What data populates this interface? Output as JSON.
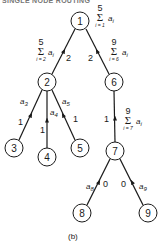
{
  "title": "SINGLE NODE ROUTING",
  "caption": "(b)",
  "nodes": [
    {
      "id": "1",
      "label": "1"
    },
    {
      "id": "2",
      "label": "2"
    },
    {
      "id": "3",
      "label": "3"
    },
    {
      "id": "4",
      "label": "4"
    },
    {
      "id": "5",
      "label": "5"
    },
    {
      "id": "6",
      "label": "6"
    },
    {
      "id": "7",
      "label": "7"
    },
    {
      "id": "8",
      "label": "8"
    },
    {
      "id": "9",
      "label": "9"
    }
  ],
  "edges": [
    {
      "from": "2",
      "to": "1",
      "weight": "2",
      "flow": "Σ a_i, i=2..5"
    },
    {
      "from": "6",
      "to": "1",
      "weight": "2",
      "flow": "Σ a_i, i=6..9"
    },
    {
      "from": "3",
      "to": "2",
      "weight": "1",
      "flow": "a3"
    },
    {
      "from": "4",
      "to": "2",
      "weight": "1",
      "flow": "a4"
    },
    {
      "from": "5",
      "to": "2",
      "weight": "1",
      "flow": "a5"
    },
    {
      "from": "7",
      "to": "6",
      "weight": "1",
      "flow": "Σ a_i, i=7..9"
    },
    {
      "from": "8",
      "to": "7",
      "weight": "0",
      "flow": "a8"
    },
    {
      "from": "9",
      "to": "7",
      "weight": "0",
      "flow": "a9"
    }
  ],
  "sums": {
    "node1": {
      "upper": "5",
      "lower": "i = 1",
      "var": "a",
      "sub": "i"
    },
    "edge21": {
      "upper": "5",
      "lower": "i = 2",
      "var": "a",
      "sub": "i"
    },
    "edge61": {
      "upper": "9",
      "lower": "i = 6",
      "var": "a",
      "sub": "i"
    },
    "edge76": {
      "upper": "9",
      "lower": "i = 7",
      "var": "a",
      "sub": "i"
    }
  },
  "weights": {
    "w21": "2",
    "w61": "2",
    "w32": "1",
    "w42": "1",
    "w52": "1",
    "w76": "1",
    "w87": "0",
    "w97": "0"
  },
  "flows": {
    "a3": {
      "var": "a",
      "sub": "3"
    },
    "a4": {
      "var": "a",
      "sub": "4"
    },
    "a5": {
      "var": "a",
      "sub": "5"
    },
    "a8": {
      "var": "a",
      "sub": "8"
    },
    "a9": {
      "var": "a",
      "sub": "9"
    }
  },
  "sigma": "Σ",
  "colors": {
    "ink": "#1a1a1a",
    "background": "#ffffff"
  }
}
